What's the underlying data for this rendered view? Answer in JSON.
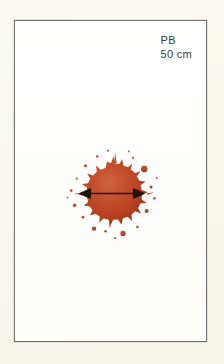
{
  "image": {
    "width": 224,
    "height": 364,
    "outer_background_color": "#faf8f0"
  },
  "card": {
    "background_color": "#ffffff",
    "border_color": "#6f7374"
  },
  "annotation": {
    "line_1": "PB",
    "line_2": "50 cm",
    "text_color": "#3a3a3c"
  },
  "stain": {
    "label": "blood-stain",
    "fill_color_center": "#c85a36",
    "fill_color_mid": "#bb4526",
    "fill_color_edge": "#9e3418",
    "satellite_color": "#b8401f",
    "diameter_measure_label": "50 cm",
    "arrow_color": "#241309"
  }
}
